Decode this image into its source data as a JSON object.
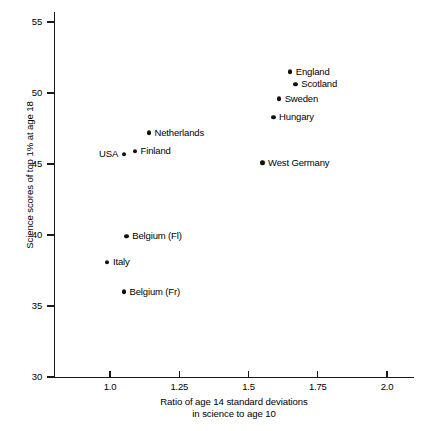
{
  "chart_data": {
    "type": "scatter",
    "title": "",
    "xlabel": "Ratio of age 14 standard deviations in science to age 10",
    "xlabel_line1": "Ratio of age 14 standard deviations",
    "xlabel_line2": "in science to age 10",
    "ylabel": "Science scores of top 1% at age 18",
    "xlim": [
      0.85,
      2.1
    ],
    "ylim": [
      30,
      55
    ],
    "xticks": [
      "1.0",
      "1.25",
      "1.5",
      "1.75",
      "2.0"
    ],
    "xtick_values": [
      1.0,
      1.25,
      1.5,
      1.75,
      2.0
    ],
    "yticks": [
      "30",
      "35",
      "40",
      "45",
      "50",
      "55"
    ],
    "ytick_values": [
      30,
      35,
      40,
      45,
      50,
      55
    ],
    "grid": false,
    "legend": false,
    "marker_color": "#111111",
    "axis_color": "#1a1a1a",
    "points": [
      {
        "label": "England",
        "x": 1.65,
        "y": 51.5,
        "label_side": "right"
      },
      {
        "label": "Scotland",
        "x": 1.67,
        "y": 50.6,
        "label_side": "right"
      },
      {
        "label": "Sweden",
        "x": 1.61,
        "y": 49.6,
        "label_side": "right"
      },
      {
        "label": "Hungary",
        "x": 1.59,
        "y": 48.3,
        "label_side": "right"
      },
      {
        "label": "Netherlands",
        "x": 1.14,
        "y": 47.2,
        "label_side": "right"
      },
      {
        "label": "Finland",
        "x": 1.09,
        "y": 45.9,
        "label_side": "right"
      },
      {
        "label": "USA",
        "x": 1.05,
        "y": 45.7,
        "label_side": "left"
      },
      {
        "label": "West Germany",
        "x": 1.55,
        "y": 45.1,
        "label_side": "right"
      },
      {
        "label": "Belgium (Fl)",
        "x": 1.06,
        "y": 39.9,
        "label_side": "right"
      },
      {
        "label": "Italy",
        "x": 0.99,
        "y": 38.1,
        "label_side": "right"
      },
      {
        "label": "Belgium (Fr)",
        "x": 1.05,
        "y": 36.0,
        "label_side": "right"
      }
    ]
  },
  "plot_geometry": {
    "x_pixel_at_1_0": 110,
    "x_pixels_per_unit": 277,
    "y_pixel_at_30": 377,
    "y_pixels_per_unit": 14.2
  }
}
